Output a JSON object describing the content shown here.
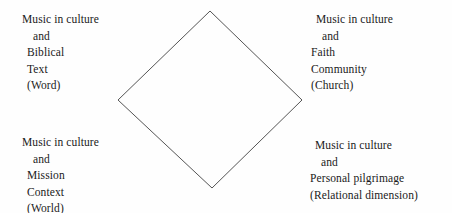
{
  "diagram": {
    "shape": {
      "name": "diamond",
      "stroke_color": "#555555",
      "fill_color": "none",
      "stroke_width": 1,
      "vertices": {
        "top": [
          210,
          11
        ],
        "right": [
          302,
          100
        ],
        "bottom": [
          212,
          188
        ],
        "left": [
          118,
          100
        ]
      }
    },
    "background_color": "#fefefe",
    "text_color": "#1a1a1a",
    "quadrants": [
      {
        "id": "word",
        "position": "top-left",
        "lines": [
          {
            "text": "Music in culture",
            "indent": "indent-0"
          },
          {
            "text": "and",
            "indent": "indent-1"
          },
          {
            "text": "Biblical",
            "indent": "indent-2"
          },
          {
            "text": "Text",
            "indent": "indent-2"
          },
          {
            "text": "(Word)",
            "indent": "indent-2"
          }
        ]
      },
      {
        "id": "church",
        "position": "top-right",
        "lines": [
          {
            "text": "Music in culture",
            "indent": "indent-2"
          },
          {
            "text": "and",
            "indent": "indent-1"
          },
          {
            "text": "Faith",
            "indent": "indent-0"
          },
          {
            "text": "Community",
            "indent": "indent-0"
          },
          {
            "text": "(Church)",
            "indent": "indent-0"
          }
        ]
      },
      {
        "id": "world",
        "position": "bottom-left",
        "lines": [
          {
            "text": "Music in culture",
            "indent": "indent-0"
          },
          {
            "text": "and",
            "indent": "indent-1"
          },
          {
            "text": "Mission",
            "indent": "indent-2"
          },
          {
            "text": "Context",
            "indent": "indent-2"
          },
          {
            "text": "(World)",
            "indent": "indent-2"
          }
        ]
      },
      {
        "id": "relational",
        "position": "bottom-right",
        "lines": [
          {
            "text": "Music in culture",
            "indent": "indent-2"
          },
          {
            "text": "and",
            "indent": "indent-1"
          },
          {
            "text": "Personal pilgrimage",
            "indent": "indent-0"
          },
          {
            "text": "(Relational dimension)",
            "indent": "indent-0"
          }
        ]
      }
    ]
  }
}
